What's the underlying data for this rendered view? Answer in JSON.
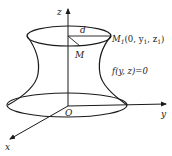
{
  "diagram": {
    "type": "surface-of-revolution",
    "axes": {
      "z_label": "z",
      "y_label": "y",
      "x_label": "x",
      "origin_label": "O"
    },
    "points": {
      "M_label": "M",
      "M1_label": "M",
      "M1_subscript": "1",
      "M1_coords": "(0,  y",
      "M1_coords_sub1": "1",
      "M1_coords_mid": ",  z",
      "M1_coords_sub2": "1",
      "M1_coords_end": ")"
    },
    "distance_label": "d",
    "curve_equation": "f(y,  z)=0",
    "colors": {
      "stroke": "#1a1a1a",
      "background": "#ffffff"
    }
  }
}
